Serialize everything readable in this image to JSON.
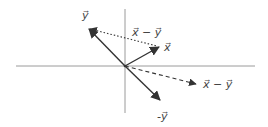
{
  "diagram": {
    "type": "vector-diagram",
    "colors": {
      "axes": "#9a9a9a",
      "vectors": "#333333",
      "labels": "#444444",
      "background": "#ffffff"
    },
    "axes": {
      "origin": [
        125,
        66
      ],
      "horizontal": {
        "x1": 16,
        "x2": 255,
        "y": 66
      },
      "vertical": {
        "x": 125,
        "y1": 9,
        "y2": 113
      }
    },
    "vectors": [
      {
        "id": "x",
        "style": "solid",
        "from": [
          125,
          66
        ],
        "to": [
          160,
          47
        ],
        "label": "x⃗"
      },
      {
        "id": "y",
        "style": "solid",
        "from": [
          125,
          66
        ],
        "to": [
          88,
          28
        ],
        "label": "y⃗"
      },
      {
        "id": "neg-y",
        "style": "solid",
        "from": [
          125,
          66
        ],
        "to": [
          161,
          101
        ],
        "label": "-y⃗"
      },
      {
        "id": "x-minus-y-translated",
        "style": "dotted",
        "from": [
          90,
          29
        ],
        "to": [
          158,
          46
        ],
        "label": "x⃗ − y⃗"
      },
      {
        "id": "x-minus-y",
        "style": "dashed",
        "from": [
          125,
          66
        ],
        "to": [
          197,
          84
        ],
        "label": "x⃗ − y⃗"
      }
    ],
    "labels": {
      "y": "y⃗",
      "x": "x⃗",
      "x_minus_y_top": "x⃗ − y⃗",
      "x_minus_y_right": "x⃗ − y⃗",
      "neg_y": "-y⃗"
    }
  }
}
